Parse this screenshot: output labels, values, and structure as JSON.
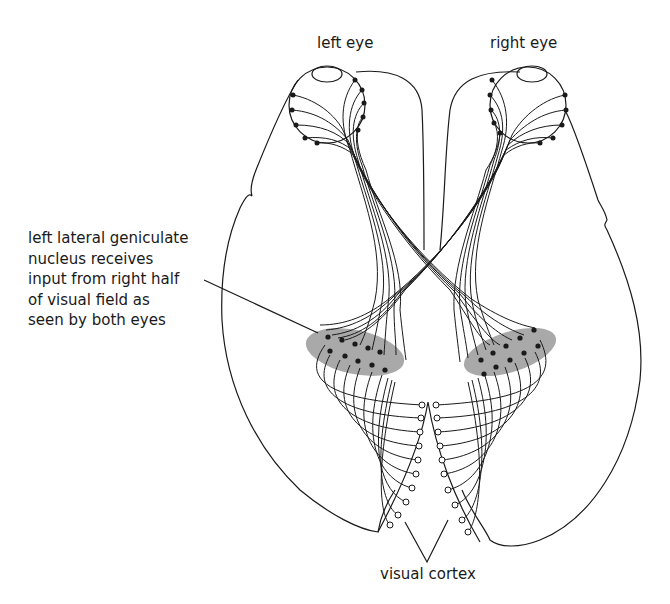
{
  "figure": {
    "labels": {
      "left_eye": "left eye",
      "right_eye": "right eye",
      "lgn_annotation": [
        "left lateral geniculate",
        "nucleus receives",
        "input from right half",
        "of visual field as",
        "seen by both eyes"
      ],
      "visual_cortex": "visual cortex"
    },
    "structures": [
      "left-eye",
      "right-eye",
      "left-hemisphere-outline",
      "right-hemisphere-outline",
      "optic-chiasm",
      "left-lateral-geniculate-nucleus",
      "right-lateral-geniculate-nucleus",
      "visual-cortex"
    ],
    "colors": {
      "line": "#1a1a1a",
      "nucleus_shading": "#9a9a9a",
      "background": "#ffffff"
    }
  }
}
